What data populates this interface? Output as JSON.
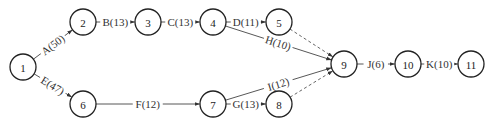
{
  "diagram": {
    "type": "activity-on-arrow network",
    "nodes": [
      {
        "id": "1",
        "label": "1",
        "x": 23,
        "y": 67
      },
      {
        "id": "2",
        "label": "2",
        "x": 83,
        "y": 22
      },
      {
        "id": "3",
        "label": "3",
        "x": 148,
        "y": 22
      },
      {
        "id": "4",
        "label": "4",
        "x": 213,
        "y": 22
      },
      {
        "id": "5",
        "label": "5",
        "x": 279,
        "y": 22
      },
      {
        "id": "6",
        "label": "6",
        "x": 83,
        "y": 104
      },
      {
        "id": "7",
        "label": "7",
        "x": 213,
        "y": 104
      },
      {
        "id": "8",
        "label": "8",
        "x": 279,
        "y": 104
      },
      {
        "id": "9",
        "label": "9",
        "x": 344,
        "y": 64
      },
      {
        "id": "10",
        "label": "10",
        "x": 408,
        "y": 64
      },
      {
        "id": "11",
        "label": "11",
        "x": 471,
        "y": 64
      }
    ],
    "edges": [
      {
        "from": "1",
        "to": "2",
        "label": "A(50)",
        "dashed": false
      },
      {
        "from": "2",
        "to": "3",
        "label": "B(13)",
        "dashed": false
      },
      {
        "from": "3",
        "to": "4",
        "label": "C(13)",
        "dashed": false
      },
      {
        "from": "4",
        "to": "5",
        "label": "D(11)",
        "dashed": false
      },
      {
        "from": "1",
        "to": "6",
        "label": "E(47)",
        "dashed": false
      },
      {
        "from": "6",
        "to": "7",
        "label": "F(12)",
        "dashed": false
      },
      {
        "from": "7",
        "to": "8",
        "label": "G(13)",
        "dashed": false
      },
      {
        "from": "4",
        "to": "9",
        "label": "H(10)",
        "dashed": false
      },
      {
        "from": "7",
        "to": "9",
        "label": "I(12)",
        "dashed": false
      },
      {
        "from": "9",
        "to": "10",
        "label": "J(6)",
        "dashed": false
      },
      {
        "from": "10",
        "to": "11",
        "label": "K(10)",
        "dashed": false
      },
      {
        "from": "5",
        "to": "9",
        "label": "",
        "dashed": true
      },
      {
        "from": "8",
        "to": "9",
        "label": "",
        "dashed": true
      }
    ]
  }
}
